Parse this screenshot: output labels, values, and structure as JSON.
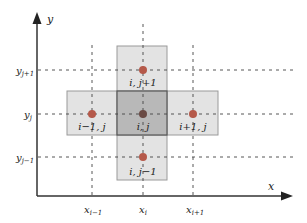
{
  "diagram": {
    "axis_x_label": "x",
    "axis_y_label": "y",
    "x_ticks": [
      {
        "base": "x",
        "sub": "i−1",
        "x": 92
      },
      {
        "base": "x",
        "sub": "i",
        "x": 143
      },
      {
        "base": "x",
        "sub": "i+1",
        "x": 193
      }
    ],
    "y_ticks": [
      {
        "base": "y",
        "sub": "j+1",
        "y": 70
      },
      {
        "base": "y",
        "sub": "j",
        "y": 114
      },
      {
        "base": "y",
        "sub": "j−1",
        "y": 157
      }
    ],
    "cells": [
      {
        "id": "top",
        "label": "i, j+1"
      },
      {
        "id": "left",
        "label": "i−1, j"
      },
      {
        "id": "center",
        "label": "i, j"
      },
      {
        "id": "right",
        "label": "i+1, j"
      },
      {
        "id": "bottom",
        "label": "i, j−1"
      }
    ],
    "colors": {
      "cell_fill": "#e3e3e3",
      "cell_stroke": "#9a9a9a",
      "center_fill": "#b8b8b8",
      "center_stroke": "#555555",
      "dot": "#b5594a",
      "center_dot": "#6a4a44",
      "axis": "#333333",
      "grid": "#444444"
    }
  }
}
